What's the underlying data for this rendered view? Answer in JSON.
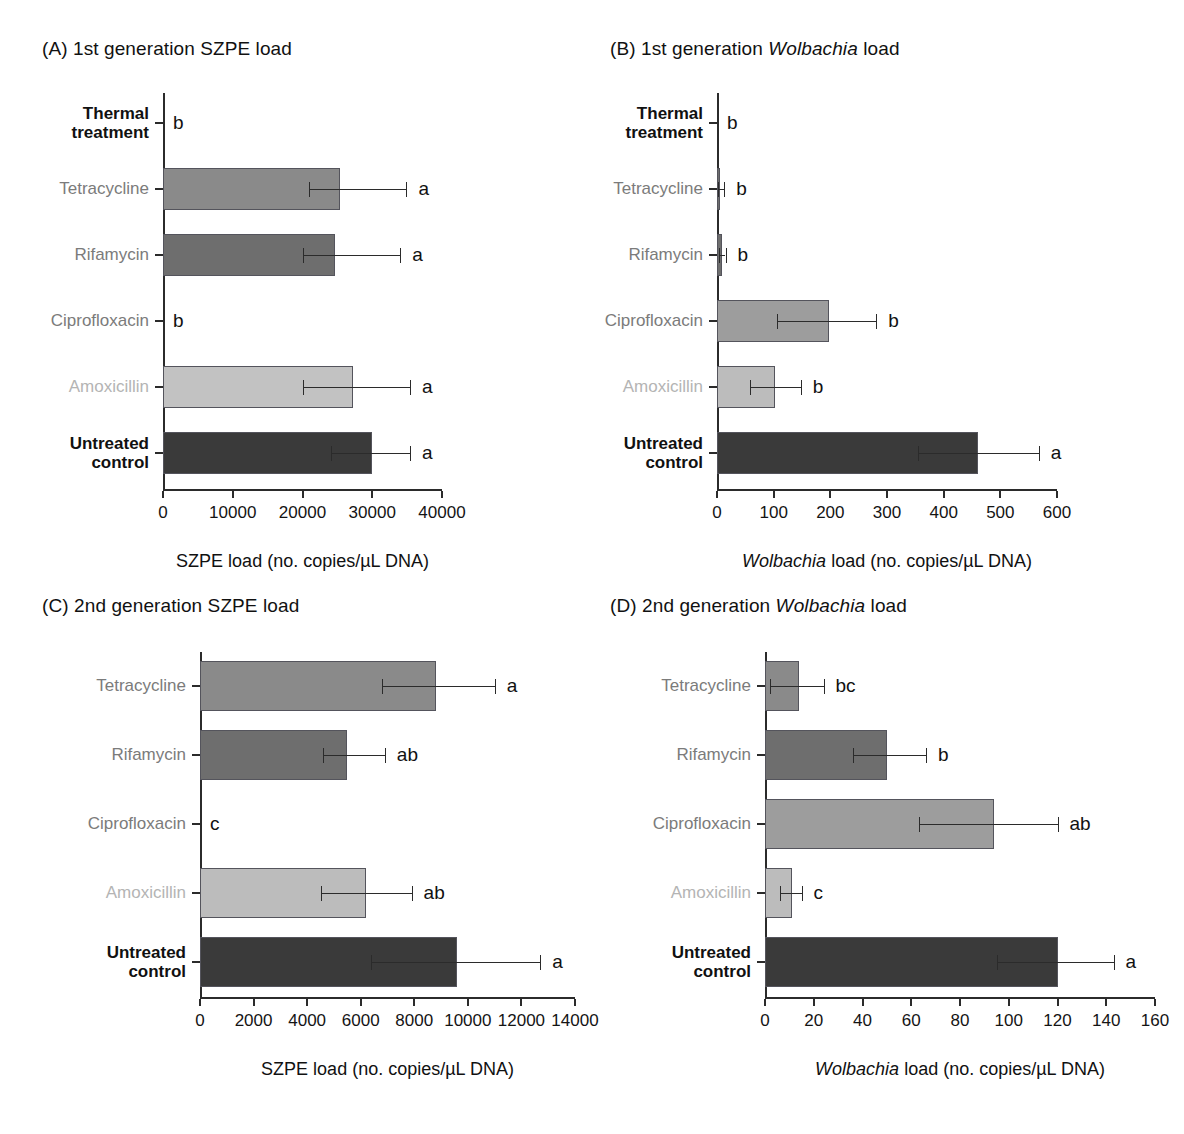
{
  "figure": {
    "background": "#ffffff",
    "series_colors": {
      "thermal_treatment": "#111111",
      "tetracycline": "#8a8a8a",
      "rifamycin": "#6e6e6e",
      "ciprofloxacin": "#9d9d9d",
      "amoxicillin": "#c2c2c2",
      "untreated_control": "#3a3a3a"
    }
  },
  "chart_data": [
    {
      "id": "panel-a",
      "type": "bar",
      "orientation": "horizontal",
      "title": "(A) 1st generation SZPE load",
      "title_plain": "(A) 1st generation SZPE load",
      "xlabel": "SZPE load (no. copies/µL DNA)",
      "ylabel": "",
      "xlim": [
        0,
        40000
      ],
      "xticks": [
        0,
        10000,
        20000,
        30000,
        40000
      ],
      "xticklabels": [
        "0",
        "10000",
        "20000",
        "30000",
        "40000"
      ],
      "grid": false,
      "legend": "none",
      "categories": [
        "Thermal treatment",
        "Tetracycline",
        "Rifamycin",
        "Ciprofloxacin",
        "Amoxicillin",
        "Untreated control"
      ],
      "category_lines": [
        [
          "Thermal",
          "treatment"
        ],
        [
          "Tetracycline"
        ],
        [
          "Rifamycin"
        ],
        [
          "Ciprofloxacin"
        ],
        [
          "Amoxicillin"
        ],
        [
          "Untreated",
          "control"
        ]
      ],
      "values": [
        0,
        25400,
        24700,
        0,
        27200,
        30000
      ],
      "err_low": [
        0,
        20900,
        20000,
        0,
        20100,
        24100
      ],
      "err_high": [
        0,
        34900,
        34000,
        0,
        35400,
        35400
      ],
      "sig_letters": [
        "b",
        "a",
        "a",
        "b",
        "a",
        "a"
      ],
      "bar_colors": [
        "#111111",
        "#8a8a8a",
        "#6e6e6e",
        "#9d9d9d",
        "#c2c2c2",
        "#3a3a3a"
      ],
      "label_tone": [
        "dark",
        "mid",
        "mid",
        "mid",
        "light",
        "dark"
      ]
    },
    {
      "id": "panel-b",
      "type": "bar",
      "orientation": "horizontal",
      "title": "(B) 1st generation Wolbachia load",
      "title_prefix": "(B) 1st generation ",
      "title_italic": "Wolbachia",
      "title_suffix": " load",
      "xlabel": "Wolbachia load (no. copies/µL DNA)",
      "xlabel_italic": "Wolbachia",
      "xlabel_rest": " load (no. copies/µL DNA)",
      "ylabel": "",
      "xlim": [
        0,
        600
      ],
      "xticks": [
        0,
        100,
        200,
        300,
        400,
        500,
        600
      ],
      "xticklabels": [
        "0",
        "100",
        "200",
        "300",
        "400",
        "500",
        "600"
      ],
      "grid": false,
      "legend": "none",
      "categories": [
        "Thermal treatment",
        "Tetracycline",
        "Rifamycin",
        "Ciprofloxacin",
        "Amoxicillin",
        "Untreated control"
      ],
      "category_lines": [
        [
          "Thermal",
          "treatment"
        ],
        [
          "Tetracycline"
        ],
        [
          "Rifamycin"
        ],
        [
          "Ciprofloxacin"
        ],
        [
          "Amoxicillin"
        ],
        [
          "Untreated",
          "control"
        ]
      ],
      "values": [
        0,
        5,
        8,
        197,
        103,
        460
      ],
      "err_low": [
        0,
        1,
        3,
        105,
        58,
        355
      ],
      "err_high": [
        0,
        13,
        15,
        281,
        148,
        568
      ],
      "sig_letters": [
        "b",
        "b",
        "b",
        "b",
        "b",
        "a"
      ],
      "bar_colors": [
        "#111111",
        "#6e6e6e",
        "#6e6e6e",
        "#9d9d9d",
        "#bcbcbc",
        "#3a3a3a"
      ],
      "label_tone": [
        "dark",
        "mid",
        "mid",
        "mid",
        "light",
        "dark"
      ]
    },
    {
      "id": "panel-c",
      "type": "bar",
      "orientation": "horizontal",
      "title": "(C) 2nd generation SZPE load",
      "title_plain": "(C) 2nd generation SZPE load",
      "xlabel": "SZPE load (no. copies/µL DNA)",
      "ylabel": "",
      "xlim": [
        0,
        14000
      ],
      "xticks": [
        0,
        2000,
        4000,
        6000,
        8000,
        10000,
        12000,
        14000
      ],
      "xticklabels": [
        "0",
        "2000",
        "4000",
        "6000",
        "8000",
        "10000",
        "12000",
        "14000"
      ],
      "grid": false,
      "legend": "none",
      "categories": [
        "Tetracycline",
        "Rifamycin",
        "Ciprofloxacin",
        "Amoxicillin",
        "Untreated control"
      ],
      "category_lines": [
        [
          "Tetracycline"
        ],
        [
          "Rifamycin"
        ],
        [
          "Ciprofloxacin"
        ],
        [
          "Amoxicillin"
        ],
        [
          "Untreated",
          "control"
        ]
      ],
      "values": [
        8800,
        5500,
        0,
        6200,
        9600
      ],
      "err_low": [
        6800,
        4600,
        0,
        4500,
        6400
      ],
      "err_high": [
        11000,
        6900,
        0,
        7900,
        12700
      ],
      "sig_letters": [
        "a",
        "ab",
        "c",
        "ab",
        "a"
      ],
      "bar_colors": [
        "#8a8a8a",
        "#6e6e6e",
        "#9d9d9d",
        "#bcbcbc",
        "#3a3a3a"
      ],
      "label_tone": [
        "mid",
        "mid",
        "mid",
        "light",
        "dark"
      ]
    },
    {
      "id": "panel-d",
      "type": "bar",
      "orientation": "horizontal",
      "title": "(D) 2nd generation Wolbachia load",
      "title_prefix": "(D) 2nd generation ",
      "title_italic": "Wolbachia",
      "title_suffix": " load",
      "xlabel": "Wolbachia load (no. copies/µL DNA)",
      "xlabel_italic": "Wolbachia",
      "xlabel_rest": " load (no. copies/µL DNA)",
      "ylabel": "",
      "xlim": [
        0,
        160
      ],
      "xticks": [
        0,
        20,
        40,
        60,
        80,
        100,
        120,
        140,
        160
      ],
      "xticklabels": [
        "0",
        "20",
        "40",
        "60",
        "80",
        "100",
        "120",
        "140",
        "160"
      ],
      "grid": false,
      "legend": "none",
      "categories": [
        "Tetracycline",
        "Rifamycin",
        "Ciprofloxacin",
        "Amoxicillin",
        "Untreated control"
      ],
      "category_lines": [
        [
          "Tetracycline"
        ],
        [
          "Rifamycin"
        ],
        [
          "Ciprofloxacin"
        ],
        [
          "Amoxicillin"
        ],
        [
          "Untreated",
          "control"
        ]
      ],
      "values": [
        14,
        50,
        94,
        11,
        120
      ],
      "err_low": [
        2,
        36,
        63,
        6,
        95
      ],
      "err_high": [
        24,
        66,
        120,
        15,
        143
      ],
      "sig_letters": [
        "bc",
        "b",
        "ab",
        "c",
        "a"
      ],
      "bar_colors": [
        "#8a8a8a",
        "#6e6e6e",
        "#9d9d9d",
        "#bcbcbc",
        "#3a3a3a"
      ],
      "label_tone": [
        "mid",
        "mid",
        "mid",
        "light",
        "dark"
      ]
    }
  ]
}
